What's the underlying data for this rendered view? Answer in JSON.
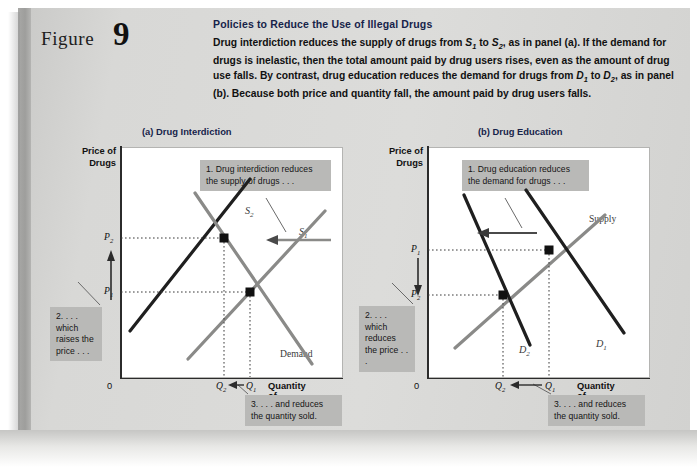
{
  "figure": {
    "label": "Figure",
    "number": "9",
    "title": "Policies to Reduce the Use of Illegal Drugs",
    "caption_parts": [
      "Drug interdiction reduces the supply of drugs from ",
      "S1",
      " to ",
      "S2",
      ", as in panel (a). If the demand for drugs is inelastic, then the total amount paid by drug users rises, even as the amount of drug use falls. By contrast, drug education reduces the demand for drugs from ",
      "D1",
      " to ",
      "D2",
      ", as in panel (b). Because both price and quantity fall, the amount paid by drug users falls."
    ],
    "caption_plain": "Drug interdiction reduces the supply of drugs from S1 to S2, as in panel (a). If the demand for drugs is inelastic, then the total amount paid by drug users rises, even as the amount of drug use falls. By contrast, drug education reduces the demand for drugs from D1 to D2, as in panel (b). Because both price and quantity fall, the amount paid by drug users falls."
  },
  "colors": {
    "page_background": "#d8d8d6",
    "plot_background": "#ffffff",
    "title_blue": "#16234a",
    "callout_gray": "#b9b9b7",
    "curve_dark": "#1f1f1f",
    "curve_gray": "#8a8a88",
    "axis": "#2b2b2b"
  },
  "panel_a": {
    "title": "(a) Drug Interdiction",
    "y_axis_label": "Price of\nDrugs",
    "y_axis_label_line1": "Price of",
    "y_axis_label_line2": "Drugs",
    "x_axis_label": "Quantity of Drugs",
    "origin": "0",
    "price_ticks": [
      "P2",
      "P1"
    ],
    "quantity_ticks": [
      "Q2",
      "Q1"
    ],
    "curve_labels": [
      "S2",
      "S1",
      "Demand"
    ],
    "callouts": [
      "1. Drug interdiction reduces the supply of drugs . . .",
      "2. . . . which raises the price . . .",
      "3. . . . and reduces the quantity sold."
    ]
  },
  "panel_b": {
    "title": "(b) Drug Education",
    "y_axis_label_line1": "Price of",
    "y_axis_label_line2": "Drugs",
    "x_axis_label": "Quantity of Drugs",
    "origin": "0",
    "price_ticks": [
      "P1",
      "P2"
    ],
    "quantity_ticks": [
      "Q2",
      "Q1"
    ],
    "curve_labels": [
      "Supply",
      "D2",
      "D1"
    ],
    "callouts": [
      "1. Drug education reduces the demand for drugs . . .",
      "2. . . . which reduces the price . . .",
      "3. . . . and reduces the quantity sold."
    ]
  },
  "chart_data": {
    "type": "line",
    "title": "Policies to Reduce the Use of Illegal Drugs",
    "panels": [
      {
        "name": "(a) Drug Interdiction",
        "xlabel": "Quantity of Drugs",
        "ylabel": "Price of Drugs",
        "series": [
          {
            "name": "S1",
            "role": "supply-original",
            "color": "#8a8a88",
            "points": [
              [
                0.3,
                0.08
              ],
              [
                0.92,
                0.72
              ]
            ]
          },
          {
            "name": "S2",
            "role": "supply-shifted",
            "color": "#1f1f1f",
            "points": [
              [
                0.04,
                0.2
              ],
              [
                0.58,
                0.86
              ]
            ]
          },
          {
            "name": "Demand",
            "role": "demand",
            "color": "#8a8a88",
            "points": [
              [
                0.33,
                0.93
              ],
              [
                0.86,
                0.16
              ]
            ]
          }
        ],
        "equilibria": [
          {
            "label": "new",
            "price_tick": "P2",
            "quantity_tick": "Q2",
            "x": 0.45,
            "y": 0.735
          },
          {
            "label": "old",
            "price_tick": "P1",
            "quantity_tick": "Q1",
            "x": 0.56,
            "y": 0.505
          }
        ],
        "shift_arrow": {
          "from_series": "S1",
          "to_series": "S2",
          "direction": "left"
        }
      },
      {
        "name": "(b) Drug Education",
        "xlabel": "Quantity of Drugs",
        "ylabel": "Price of Drugs",
        "series": [
          {
            "name": "Supply",
            "role": "supply",
            "color": "#8a8a88",
            "points": [
              [
                0.12,
                0.13
              ],
              [
                0.8,
                0.88
              ]
            ]
          },
          {
            "name": "D1",
            "role": "demand-original",
            "color": "#1f1f1f",
            "points": [
              [
                0.44,
                0.95
              ],
              [
                0.93,
                0.18
              ]
            ]
          },
          {
            "name": "D2",
            "role": "demand-shifted",
            "color": "#1f1f1f",
            "points": [
              [
                0.13,
                0.92
              ],
              [
                0.6,
                0.18
              ]
            ]
          }
        ],
        "equilibria": [
          {
            "label": "old",
            "price_tick": "P1",
            "quantity_tick": "Q1",
            "x": 0.665,
            "y": 0.715
          },
          {
            "label": "new",
            "price_tick": "P2",
            "quantity_tick": "Q2",
            "x": 0.45,
            "y": 0.5
          }
        ],
        "shift_arrow": {
          "from_series": "D1",
          "to_series": "D2",
          "direction": "left"
        }
      }
    ]
  }
}
